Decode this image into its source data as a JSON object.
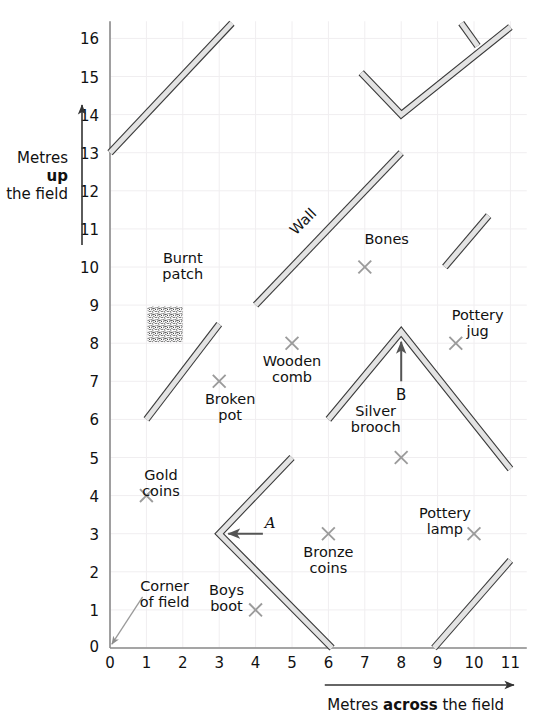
{
  "figure": {
    "background": "#ffffff",
    "grid_color": "#f0eef0",
    "axis_color": "#8a8a8a",
    "wall_fill": "#e3e3e3",
    "wall_stroke": "#3a3a3a",
    "cross_color": "#9b9b9b",
    "arrow_color": "#555555"
  },
  "axes": {
    "x": {
      "caption_pre": "Metres ",
      "caption_bold": "across",
      "caption_post": " the field",
      "min": 0,
      "max": 11,
      "ticks": [
        "0",
        "1",
        "2",
        "3",
        "4",
        "5",
        "6",
        "7",
        "8",
        "9",
        "10",
        "11"
      ]
    },
    "y": {
      "caption_line1": "Metres",
      "caption_line2": "up",
      "caption_line3": "the field",
      "min": 0,
      "max": 16,
      "ticks": [
        "0",
        "1",
        "2",
        "3",
        "4",
        "5",
        "6",
        "7",
        "8",
        "9",
        "10",
        "11",
        "12",
        "13",
        "14",
        "15",
        "16"
      ],
      "origin_label": "0"
    }
  },
  "chart_data": {
    "type": "scatter",
    "xlabel": "Metres across the field",
    "ylabel": "Metres up the field",
    "xlim": [
      0,
      11.4
    ],
    "ylim": [
      0,
      16.4
    ],
    "grid": true,
    "finds": [
      {
        "name": "Burnt patch",
        "label": "Burnt\npatch",
        "x": 1.5,
        "y": 8.5,
        "marker": "stipple-square",
        "label_x": 2.0,
        "label_y": 10.1
      },
      {
        "name": "Broken pot",
        "label": "Broken\npot",
        "x": 3,
        "y": 7,
        "marker": "cross",
        "label_x": 3.3,
        "label_y": 6.4
      },
      {
        "name": "Gold coins",
        "label": "Gold\ncoins",
        "x": 1,
        "y": 4,
        "marker": "cross",
        "label_x": 1.4,
        "label_y": 4.4
      },
      {
        "name": "Boys boot",
        "label": "Boys\nboot",
        "x": 4,
        "y": 1,
        "marker": "cross",
        "label_x": 3.2,
        "label_y": 1.4
      },
      {
        "name": "Wooden comb",
        "label": "Wooden\ncomb",
        "x": 5,
        "y": 8,
        "marker": "cross",
        "label_x": 5.0,
        "label_y": 7.4
      },
      {
        "name": "Bones",
        "label": "Bones",
        "x": 7,
        "y": 10,
        "marker": "cross",
        "label_x": 7.6,
        "label_y": 10.6
      },
      {
        "name": "Bronze coins",
        "label": "Bronze\ncoins",
        "x": 6,
        "y": 3,
        "marker": "cross",
        "label_x": 6.0,
        "label_y": 2.4
      },
      {
        "name": "Silver brooch",
        "label": "Silver\nbrooch",
        "x": 8,
        "y": 5,
        "marker": "cross",
        "label_x": 7.3,
        "label_y": 6.1
      },
      {
        "name": "Pottery jug",
        "label": "Pottery\njug",
        "x": 9.5,
        "y": 8,
        "marker": "cross",
        "label_x": 10.1,
        "label_y": 8.6
      },
      {
        "name": "Pottery lamp",
        "label": "Pottery\nlamp",
        "x": 10,
        "y": 3,
        "marker": "cross",
        "label_x": 9.2,
        "label_y": 3.4
      }
    ],
    "walls": [
      {
        "name": "wall-top-left",
        "points": [
          [
            0,
            13
          ],
          [
            3.35,
            16.4
          ]
        ]
      },
      {
        "name": "wall-main-diagonal",
        "points": [
          [
            4,
            9
          ],
          [
            8,
            13
          ]
        ],
        "label": "Wall",
        "label_x": 5.4,
        "label_y": 11.1,
        "label_rotation": -45
      },
      {
        "name": "wall-small-top",
        "points": [
          [
            9.65,
            16.4
          ],
          [
            10.1,
            15.8
          ]
        ]
      },
      {
        "name": "wall-vee-top",
        "points": [
          [
            6.9,
            15.1
          ],
          [
            8.0,
            14.0
          ],
          [
            11.0,
            16.3
          ]
        ]
      },
      {
        "name": "wall-right-upper",
        "points": [
          [
            9.2,
            10.0
          ],
          [
            10.4,
            11.35
          ]
        ]
      },
      {
        "name": "wall-broken-pot",
        "points": [
          [
            1,
            6
          ],
          [
            3,
            8.5
          ]
        ]
      },
      {
        "name": "wall-vee-B",
        "points": [
          [
            6,
            6
          ],
          [
            8,
            8.3
          ],
          [
            11,
            4.7
          ]
        ]
      },
      {
        "name": "wall-vee-A",
        "points": [
          [
            5,
            5
          ],
          [
            3,
            3
          ],
          [
            6.1,
            0
          ]
        ]
      },
      {
        "name": "wall-bottom-right",
        "points": [
          [
            8.9,
            0
          ],
          [
            11.0,
            2.3
          ]
        ]
      }
    ],
    "markers": [
      {
        "name": "point-A",
        "label": "A",
        "x": 3,
        "y": 3,
        "arrow_from_x": 4.2,
        "arrow_from_y": 3,
        "label_x": 4.4,
        "label_y": 3.15
      },
      {
        "name": "point-B",
        "label": "B",
        "x": 8,
        "y": 8.3,
        "arrow_from_x": 8,
        "arrow_from_y": 7.0,
        "label_x": 8.0,
        "label_y": 6.5
      }
    ],
    "annotations": [
      {
        "name": "corner-of-field",
        "label": "Corner\nof field",
        "label_x": 1.5,
        "label_y": 1.5,
        "arrow_to_x": 0.05,
        "arrow_to_y": 0.1
      }
    ]
  }
}
